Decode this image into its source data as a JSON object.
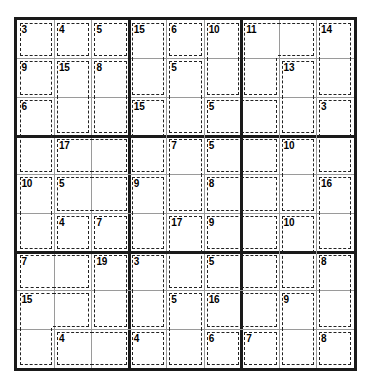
{
  "puzzle": {
    "type": "killer-sudoku",
    "title": "Killer Sudoku",
    "grid_size": 9,
    "box_size": 3,
    "colors": {
      "outer_border": "#1a1a1a",
      "box_line": "#1a1a1a",
      "cell_line": "#9a9a9a",
      "cage_line": "#222222",
      "background": "#ffffff",
      "text": "#000000"
    },
    "geometry": {
      "grid_left": 14,
      "grid_top": 17,
      "grid_width": 343,
      "grid_height": 354
    },
    "given_values": [],
    "cages": [
      {
        "sum": "3",
        "cells": [
          [
            0,
            0
          ]
        ]
      },
      {
        "sum": "4",
        "cells": [
          [
            0,
            1
          ]
        ]
      },
      {
        "sum": "5",
        "cells": [
          [
            0,
            2
          ]
        ]
      },
      {
        "sum": "15",
        "cells": [
          [
            0,
            3
          ],
          [
            1,
            3
          ]
        ]
      },
      {
        "sum": "6",
        "cells": [
          [
            0,
            4
          ]
        ]
      },
      {
        "sum": "10",
        "cells": [
          [
            0,
            5
          ],
          [
            1,
            5
          ]
        ]
      },
      {
        "sum": "11",
        "cells": [
          [
            0,
            6
          ],
          [
            0,
            7
          ],
          [
            1,
            6
          ]
        ]
      },
      {
        "sum": "14",
        "cells": [
          [
            0,
            8
          ],
          [
            1,
            8
          ]
        ]
      },
      {
        "sum": "9",
        "cells": [
          [
            1,
            0
          ]
        ]
      },
      {
        "sum": "15",
        "cells": [
          [
            1,
            1
          ],
          [
            2,
            1
          ]
        ]
      },
      {
        "sum": "8",
        "cells": [
          [
            1,
            2
          ],
          [
            2,
            2
          ]
        ]
      },
      {
        "sum": "5",
        "cells": [
          [
            1,
            4
          ],
          [
            2,
            4
          ]
        ]
      },
      {
        "sum": "13",
        "cells": [
          [
            1,
            7
          ],
          [
            2,
            7
          ]
        ]
      },
      {
        "sum": "6",
        "cells": [
          [
            2,
            0
          ],
          [
            3,
            0
          ]
        ]
      },
      {
        "sum": "15",
        "cells": [
          [
            2,
            3
          ],
          [
            3,
            3
          ]
        ]
      },
      {
        "sum": "5",
        "cells": [
          [
            2,
            5
          ],
          [
            2,
            6
          ]
        ]
      },
      {
        "sum": "3",
        "cells": [
          [
            2,
            8
          ],
          [
            3,
            8
          ]
        ]
      },
      {
        "sum": "17",
        "cells": [
          [
            3,
            1
          ],
          [
            3,
            2
          ]
        ]
      },
      {
        "sum": "7",
        "cells": [
          [
            3,
            4
          ],
          [
            4,
            4
          ]
        ]
      },
      {
        "sum": "5",
        "cells": [
          [
            3,
            5
          ],
          [
            3,
            6
          ]
        ]
      },
      {
        "sum": "10",
        "cells": [
          [
            3,
            7
          ],
          [
            4,
            7
          ]
        ]
      },
      {
        "sum": "10",
        "cells": [
          [
            4,
            0
          ],
          [
            5,
            0
          ]
        ]
      },
      {
        "sum": "5",
        "cells": [
          [
            4,
            1
          ],
          [
            4,
            2
          ]
        ]
      },
      {
        "sum": "9",
        "cells": [
          [
            4,
            3
          ],
          [
            5,
            3
          ]
        ]
      },
      {
        "sum": "8",
        "cells": [
          [
            4,
            5
          ],
          [
            4,
            6
          ]
        ]
      },
      {
        "sum": "16",
        "cells": [
          [
            4,
            8
          ],
          [
            5,
            8
          ]
        ]
      },
      {
        "sum": "4",
        "cells": [
          [
            5,
            1
          ]
        ]
      },
      {
        "sum": "7",
        "cells": [
          [
            5,
            2
          ]
        ]
      },
      {
        "sum": "17",
        "cells": [
          [
            5,
            4
          ],
          [
            6,
            4
          ]
        ]
      },
      {
        "sum": "9",
        "cells": [
          [
            5,
            5
          ],
          [
            5,
            6
          ]
        ]
      },
      {
        "sum": "10",
        "cells": [
          [
            5,
            7
          ],
          [
            6,
            7
          ]
        ]
      },
      {
        "sum": "7",
        "cells": [
          [
            6,
            0
          ],
          [
            6,
            1
          ]
        ]
      },
      {
        "sum": "19",
        "cells": [
          [
            6,
            2
          ],
          [
            7,
            2
          ]
        ]
      },
      {
        "sum": "3",
        "cells": [
          [
            6,
            3
          ],
          [
            7,
            3
          ]
        ]
      },
      {
        "sum": "5",
        "cells": [
          [
            6,
            5
          ],
          [
            6,
            6
          ]
        ]
      },
      {
        "sum": "8",
        "cells": [
          [
            6,
            8
          ],
          [
            7,
            8
          ]
        ]
      },
      {
        "sum": "15",
        "cells": [
          [
            7,
            0
          ],
          [
            7,
            1
          ],
          [
            8,
            0
          ]
        ]
      },
      {
        "sum": "5",
        "cells": [
          [
            7,
            4
          ],
          [
            8,
            4
          ]
        ]
      },
      {
        "sum": "16",
        "cells": [
          [
            7,
            5
          ],
          [
            7,
            6
          ]
        ]
      },
      {
        "sum": "9",
        "cells": [
          [
            7,
            7
          ],
          [
            8,
            7
          ]
        ]
      },
      {
        "sum": "4",
        "cells": [
          [
            8,
            1
          ],
          [
            8,
            2
          ]
        ]
      },
      {
        "sum": "4",
        "cells": [
          [
            8,
            3
          ]
        ]
      },
      {
        "sum": "6",
        "cells": [
          [
            8,
            5
          ]
        ]
      },
      {
        "sum": "7",
        "cells": [
          [
            8,
            6
          ]
        ]
      },
      {
        "sum": "8",
        "cells": [
          [
            8,
            8
          ]
        ]
      }
    ]
  }
}
